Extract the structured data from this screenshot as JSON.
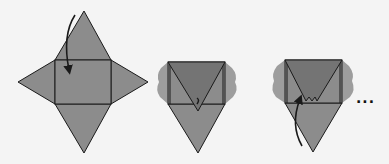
{
  "figure": {
    "colors": {
      "background": "#f4f4f4",
      "face": "#8c8c8c",
      "folded_flap": "#747474",
      "side_flap": "#9d9d9d",
      "stroke": "#1a1a1a"
    },
    "steps": [
      {
        "id": 1,
        "label": "flat net with fold arrow"
      },
      {
        "id": 2,
        "label": "top triangle folded down"
      },
      {
        "id": 3,
        "label": "bottom triangle folded up"
      }
    ],
    "continuation": "..."
  }
}
